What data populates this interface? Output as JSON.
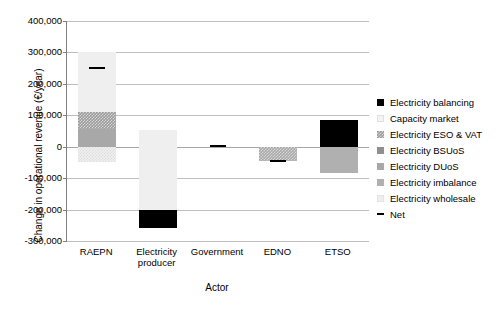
{
  "chart_data": {
    "type": "bar",
    "title": "",
    "subtitle": "",
    "xlabel": "Actor",
    "ylabel": "Change in operational revenue (€/year)",
    "categories": [
      "RAEPN",
      "Electricity\nproducer",
      "Government",
      "EDNO",
      "ETSO"
    ],
    "category_labels": [
      {
        "line1": "RAEPN",
        "line2": ""
      },
      {
        "line1": "Electricity",
        "line2": "producer"
      },
      {
        "line1": "Government",
        "line2": ""
      },
      {
        "line1": "EDNO",
        "line2": ""
      },
      {
        "line1": "ETSO",
        "line2": ""
      }
    ],
    "ylim": [
      -300000,
      400000
    ],
    "ytick_step": 100000,
    "ytick_labels": [
      "400,000",
      "300,000",
      "200,000",
      "100,000",
      "0",
      "-100,000",
      "-200,000",
      "-300,000"
    ],
    "ytick_values": [
      400000,
      300000,
      200000,
      100000,
      0,
      -100000,
      -200000,
      -300000
    ],
    "grid": true,
    "grid_axis": "y",
    "stacked": true,
    "legend_position": "right",
    "series": [
      {
        "name": "Electricity balancing",
        "color": "#000000",
        "values": [
          0,
          -55000,
          0,
          0,
          85000
        ]
      },
      {
        "name": "Capacity market",
        "color": "#f4f4f4",
        "values": [
          -50000,
          0,
          0,
          0,
          0
        ]
      },
      {
        "name": "Electricity ESO & VAT",
        "color": "#9a9a9a",
        "values": [
          57000,
          0,
          0,
          0,
          0
        ]
      },
      {
        "name": "Electricity BSUoS",
        "color": "#8f8f8f",
        "values": [
          0,
          0,
          0,
          0,
          0
        ]
      },
      {
        "name": "Electricity DUoS",
        "color": "#a8a8a8",
        "values": [
          55000,
          0,
          0,
          -45000,
          0
        ]
      },
      {
        "name": "Electricity imbalance",
        "color": "#b0b0b0",
        "values": [
          0,
          0,
          0,
          0,
          -85000
        ]
      },
      {
        "name": "Electricity wholesale",
        "color": "#efefef",
        "values": [
          190000,
          -250000,
          0,
          0,
          0
        ]
      }
    ],
    "net": {
      "name": "Net",
      "marker": "-",
      "color": "#000000",
      "values": [
        250000,
        -255000,
        2000,
        -47000,
        5000
      ]
    },
    "bar_segments": [
      {
        "category": "RAEPN",
        "segments": [
          {
            "series": "Electricity wholesale",
            "from": 110000,
            "to": 300000,
            "fill": "fill-wholesale"
          },
          {
            "series": "Electricity ESO & VAT",
            "from": 55000,
            "to": 110000,
            "fill": "fill-eso"
          },
          {
            "series": "Electricity DUoS",
            "from": 0,
            "to": 55000,
            "fill": "fill-duos"
          },
          {
            "series": "Capacity market",
            "from": -50000,
            "to": 0,
            "fill": "fill-capacity-hatch"
          }
        ]
      },
      {
        "category": "Electricity producer",
        "segments": [
          {
            "series": "Electricity wholesale",
            "from": -200000,
            "to": 52000,
            "fill": "fill-wholesale"
          },
          {
            "series": "Electricity balancing",
            "from": -258000,
            "to": -200000,
            "fill": "fill-balancing"
          }
        ]
      },
      {
        "category": "Government",
        "segments": []
      },
      {
        "category": "EDNO",
        "segments": [
          {
            "series": "Electricity DUoS",
            "from": -45000,
            "to": 0,
            "fill": "fill-duos-hatch"
          }
        ]
      },
      {
        "category": "ETSO",
        "segments": [
          {
            "series": "Electricity balancing",
            "from": 0,
            "to": 85000,
            "fill": "fill-balancing"
          },
          {
            "series": "Electricity imbalance",
            "from": -85000,
            "to": 0,
            "fill": "fill-imbalance"
          }
        ]
      }
    ]
  },
  "legend": {
    "items": [
      {
        "label": "Electricity balancing",
        "swatch": "fill-balancing",
        "kind": "box"
      },
      {
        "label": "Capacity market",
        "swatch": "fill-capacity",
        "kind": "box"
      },
      {
        "label": "Electricity ESO & VAT",
        "swatch": "fill-eso",
        "kind": "box"
      },
      {
        "label": "Electricity BSUoS",
        "swatch": "fill-bsuos",
        "kind": "box"
      },
      {
        "label": "Electricity DUoS",
        "swatch": "fill-duos",
        "kind": "box"
      },
      {
        "label": "Electricity imbalance",
        "swatch": "fill-imbalance",
        "kind": "box"
      },
      {
        "label": "Electricity wholesale",
        "swatch": "fill-wholesale",
        "kind": "box"
      },
      {
        "label": "Net",
        "swatch": "netmark",
        "kind": "line"
      }
    ]
  }
}
